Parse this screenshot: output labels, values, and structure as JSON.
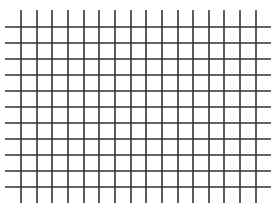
{
  "grid": {
    "line_color": "#333333",
    "background": "#ffffff",
    "line_width": 1.6,
    "vertical_lines": {
      "count": 16,
      "x_positions": [
        21,
        37,
        52,
        68,
        84,
        99,
        115,
        131,
        146,
        162,
        178,
        193,
        209,
        224,
        240,
        256
      ],
      "y_start": 10,
      "y_end": 203
    },
    "horizontal_lines": {
      "count": 11,
      "y_positions": [
        27,
        43,
        59,
        75,
        91,
        107,
        123,
        139,
        155,
        171,
        187
      ],
      "x_start": 5,
      "x_end": 271
    }
  }
}
